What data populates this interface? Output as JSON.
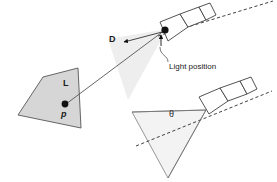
{
  "figure": {
    "background_color": "#ffffff",
    "width": 277,
    "height": 182
  },
  "labels": {
    "direction_vector": "D",
    "light_vector": "L",
    "surface_point": "p",
    "cone_angle": "θ",
    "light_position": "Light position"
  },
  "colors": {
    "stroke": "#4a4a4a",
    "stroke_dark": "#2b2b2b",
    "surface_fill": "#d6d6d6",
    "cone_fill_top": "#ededed",
    "cone_fill_bottom": "#f2f2f2",
    "fixture_fill": "#ffffff",
    "marker_fill": "#111111",
    "text": "#1a1a1a"
  },
  "elements": {
    "surface_quad": "quadrilateral-surface",
    "top_light_fixture": "spotlight-fixture-top",
    "bottom_light_fixture": "spotlight-fixture-bottom",
    "top_light_cone": "light-cone-top",
    "bottom_light_cone": "light-cone-bottom",
    "light_ray": "light-ray-line",
    "direction_ray": "direction-ray-line",
    "axis_top": "spotlight-axis-dashed-top",
    "axis_bottom": "spotlight-axis-dashed-bottom",
    "callout": "light-position-callout-line",
    "light_point": "light-source-point",
    "surface_point": "surface-point-marker"
  }
}
